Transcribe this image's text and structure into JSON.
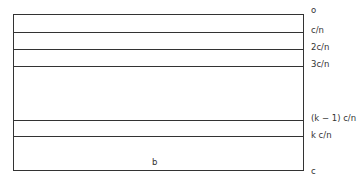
{
  "diagram": {
    "levels": [
      {
        "label": "o",
        "y": 14
      },
      {
        "label": "c/n",
        "y": 32
      },
      {
        "label": "2c/n",
        "y": 49
      },
      {
        "label": "3c/n",
        "y": 66
      },
      {
        "label": "(k − 1) c/n",
        "y": 120
      },
      {
        "label": "k c/n",
        "y": 136
      },
      {
        "label": "c",
        "y": 171
      }
    ],
    "bottom_label": "b"
  }
}
